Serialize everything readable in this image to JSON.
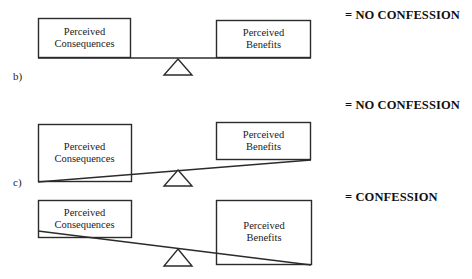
{
  "figure": {
    "stroke_color": "#2b2b2b",
    "fill_color": "#ffffff",
    "text_color": "#1a1a1a"
  },
  "panels": [
    {
      "id": "a",
      "label": "",
      "left_box": {
        "line1": "Perceived",
        "line2": "Consequences"
      },
      "right_box": {
        "line1": "Perceived",
        "line2": "Benefits"
      },
      "beam_state": "level",
      "outcome": "= NO CONFESSION"
    },
    {
      "id": "b",
      "label": "b)",
      "left_box": {
        "line1": "Perceived",
        "line2": "Consequences"
      },
      "right_box": {
        "line1": "Perceived",
        "line2": "Benefits"
      },
      "beam_state": "tilted-left-down",
      "outcome": "= NO CONFESSION"
    },
    {
      "id": "c",
      "label": "c)",
      "left_box": {
        "line1": "Perceived",
        "line2": "Consequences"
      },
      "right_box": {
        "line1": "Perceived",
        "line2": "Benefits"
      },
      "beam_state": "tilted-right-down",
      "outcome": "= CONFESSION"
    }
  ],
  "icons": {
    "fulcrum": "triangle-fulcrum-icon",
    "beam": "balance-beam-icon"
  }
}
